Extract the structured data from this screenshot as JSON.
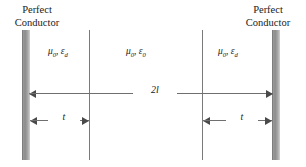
{
  "figure": {
    "type": "parallel-plate-dielectric-cross-section",
    "background_color": "#ffffff",
    "width": 306,
    "height": 167
  },
  "labels": {
    "left_conductor_line1": "Perfect",
    "left_conductor_line2": "Conductor",
    "right_conductor_line1": "Perfect",
    "right_conductor_line2": "Conductor"
  },
  "media": {
    "left": {
      "mu": "μ",
      "mu_sub": "0",
      "eps": "ε",
      "eps_sub": "d",
      "separator": ", "
    },
    "center": {
      "mu": "μ",
      "mu_sub": "0",
      "eps": "ε",
      "eps_sub": "0",
      "separator": ", "
    },
    "right": {
      "mu": "μ",
      "mu_sub": "0",
      "eps": "ε",
      "eps_sub": "d",
      "separator": ", "
    }
  },
  "dimensions": {
    "total": "2l",
    "thickness_left": "t",
    "thickness_right": "t"
  },
  "colors": {
    "conductor_fill": "#8c8c8c",
    "conductor_edge": "#7d7d7d",
    "interface_line": "#7a7a7a",
    "dimension_line": "#6f6f6f",
    "arrowhead": "#4a4a4a",
    "text": "#1a1a1a"
  }
}
